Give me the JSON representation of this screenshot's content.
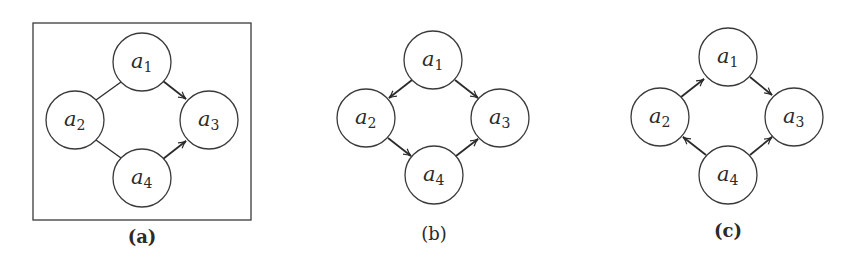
{
  "figure": {
    "panels": [
      {
        "id": "a",
        "caption": "(a)",
        "framed": true,
        "nodes": [
          {
            "id": "a1",
            "base": "a",
            "sub": "1"
          },
          {
            "id": "a2",
            "base": "a",
            "sub": "2"
          },
          {
            "id": "a3",
            "base": "a",
            "sub": "3"
          },
          {
            "id": "a4",
            "base": "a",
            "sub": "4"
          }
        ],
        "edges": [
          {
            "from": "a1",
            "to": "a2",
            "directed": false
          },
          {
            "from": "a2",
            "to": "a4",
            "directed": false
          },
          {
            "from": "a1",
            "to": "a3",
            "directed": true
          },
          {
            "from": "a4",
            "to": "a3",
            "directed": true
          }
        ]
      },
      {
        "id": "b",
        "caption": "(b)",
        "framed": false,
        "nodes": [
          {
            "id": "a1",
            "base": "a",
            "sub": "1"
          },
          {
            "id": "a2",
            "base": "a",
            "sub": "2"
          },
          {
            "id": "a3",
            "base": "a",
            "sub": "3"
          },
          {
            "id": "a4",
            "base": "a",
            "sub": "4"
          }
        ],
        "edges": [
          {
            "from": "a1",
            "to": "a2",
            "directed": true
          },
          {
            "from": "a1",
            "to": "a3",
            "directed": true
          },
          {
            "from": "a2",
            "to": "a4",
            "directed": true
          },
          {
            "from": "a4",
            "to": "a3",
            "directed": true
          }
        ]
      },
      {
        "id": "c",
        "caption": "(c)",
        "framed": false,
        "nodes": [
          {
            "id": "a1",
            "base": "a",
            "sub": "1"
          },
          {
            "id": "a2",
            "base": "a",
            "sub": "2"
          },
          {
            "id": "a3",
            "base": "a",
            "sub": "3"
          },
          {
            "id": "a4",
            "base": "a",
            "sub": "4"
          }
        ],
        "edges": [
          {
            "from": "a2",
            "to": "a1",
            "directed": true
          },
          {
            "from": "a1",
            "to": "a3",
            "directed": true
          },
          {
            "from": "a4",
            "to": "a2",
            "directed": true
          },
          {
            "from": "a4",
            "to": "a3",
            "directed": true
          }
        ]
      }
    ]
  }
}
